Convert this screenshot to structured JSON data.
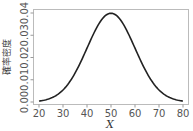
{
  "chart_data": {
    "type": "line",
    "title": "",
    "xlabel": "X",
    "ylabel": "確率密度",
    "xlim": [
      18,
      82
    ],
    "ylim": [
      -0.001,
      0.0405
    ],
    "x_ticks": [
      20,
      30,
      40,
      50,
      60,
      70,
      80
    ],
    "x_tick_labels": [
      "20",
      "30",
      "40",
      "50",
      "60",
      "70",
      "80"
    ],
    "y_ticks": [
      0.0,
      0.01,
      0.02,
      0.03,
      0.04
    ],
    "y_tick_labels": [
      "0.00",
      "0.01",
      "0.02",
      "0.03",
      "0.04"
    ],
    "grid": false,
    "legend": null,
    "series": [
      {
        "name": "Normal density (mean 50, sd 10)",
        "distribution": {
          "mean": 50,
          "sd": 10
        },
        "x": [
          20,
          25,
          30,
          35,
          40,
          45,
          50,
          55,
          60,
          65,
          70,
          75,
          80
        ],
        "y": [
          0.0004,
          0.0018,
          0.0054,
          0.013,
          0.0242,
          0.0352,
          0.0399,
          0.0352,
          0.0242,
          0.013,
          0.0054,
          0.0018,
          0.0004
        ],
        "color": "#222222"
      }
    ]
  }
}
